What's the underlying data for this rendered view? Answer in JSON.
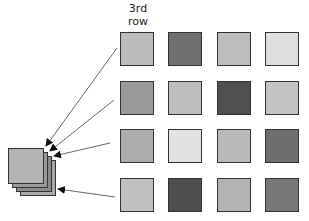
{
  "label": {
    "line1": "3rd",
    "line2": "row"
  },
  "grid": {
    "rows": [
      [
        "#bcbcbc",
        "#707070",
        "#bdbdbd",
        "#dedede"
      ],
      [
        "#999999",
        "#bebebe",
        "#505050",
        "#c3c3c3"
      ],
      [
        "#acacac",
        "#e2e2e2",
        "#b9b9b9",
        "#6e6e6e"
      ],
      [
        "#c0c0c0",
        "#4f4f4f",
        "#b3b3b3",
        "#777777"
      ]
    ],
    "col_x": [
      120,
      168,
      217,
      265
    ],
    "row_y": [
      32,
      81,
      129,
      178
    ]
  },
  "stack": {
    "squares": [
      {
        "x": 20,
        "y": 160,
        "color": "#a8a8a8"
      },
      {
        "x": 16,
        "y": 156,
        "color": "#8a8a8a"
      },
      {
        "x": 12,
        "y": 152,
        "color": "#9a9a9a"
      },
      {
        "x": 8,
        "y": 148,
        "color": "#b4b4b4"
      }
    ]
  },
  "arrows": [
    {
      "x1": 117,
      "y1": 48,
      "x2": 46,
      "y2": 146
    },
    {
      "x1": 114,
      "y1": 100,
      "x2": 50,
      "y2": 151
    },
    {
      "x1": 110,
      "y1": 143,
      "x2": 54,
      "y2": 156
    },
    {
      "x1": 115,
      "y1": 197,
      "x2": 58,
      "y2": 189
    }
  ],
  "colors": {
    "stroke": "#333333",
    "arrow": "#555555"
  }
}
